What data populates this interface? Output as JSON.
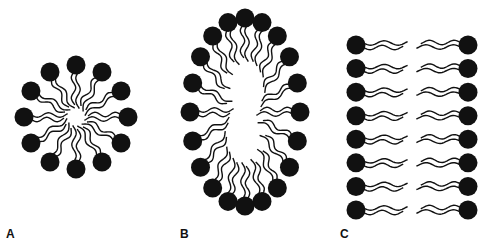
{
  "figure": {
    "colors": {
      "head": "#111111",
      "tail": "#111111",
      "background": "#ffffff"
    },
    "panels": [
      {
        "id": "A",
        "label": "A",
        "structure": "micelle",
        "label_pos": [
          6,
          227
        ],
        "center": [
          76,
          117
        ],
        "rx": 52,
        "ry": 52,
        "heads": 12,
        "head_r": 9.5,
        "tail_len": 36
      },
      {
        "id": "B",
        "label": "B",
        "structure": "liposome",
        "label_pos": [
          180,
          227
        ],
        "center": [
          245,
          112
        ],
        "rx": 55,
        "ry": 94,
        "heads": 20,
        "head_r": 9.5,
        "tail_len": 36
      },
      {
        "id": "C",
        "label": "C",
        "structure": "bilayer",
        "label_pos": [
          340,
          227
        ],
        "rows": 8,
        "y_start": 45,
        "y_end": 210,
        "left_x": 356,
        "right_x": 468,
        "head_r": 9.5,
        "tail_len": 44
      }
    ]
  }
}
